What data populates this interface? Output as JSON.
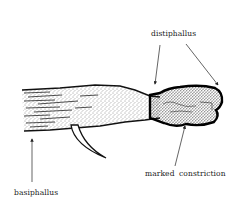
{
  "figure": {
    "labels": {
      "distiphallus": "distiphallus",
      "marked_constriction": "marked  constriction",
      "basiphallus": "basiphallus"
    },
    "colors": {
      "ink": "#111111",
      "background": "#ffffff"
    }
  }
}
